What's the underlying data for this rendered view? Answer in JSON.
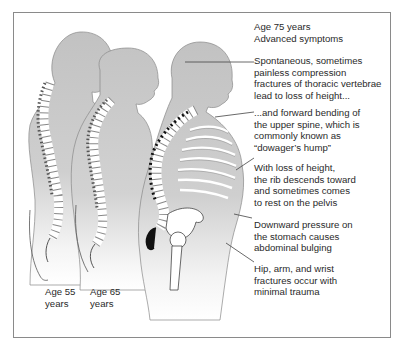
{
  "figure": {
    "ages": [
      {
        "label": "Age 55\nyears"
      },
      {
        "label": "Age 65\nyears"
      }
    ],
    "header": {
      "age": "Age 75 years",
      "subtitle": "Advanced symptoms"
    },
    "annotations": [
      {
        "text": "Spontaneous, sometimes\npainless compression\nfractures of thoracic vertebrae\nlead to loss of height..."
      },
      {
        "text": "...and forward bending of\nthe upper spine, which is\ncommonly known as\n“dowager’s hump”"
      },
      {
        "text": "With loss of height,\nthe rib descends toward\nand sometimes comes\nto rest on the pelvis"
      },
      {
        "text": "Downward pressure on\nthe stomach causes\nabdominal bulging"
      },
      {
        "text": "Hip, arm, and wrist\nfractures occur with\nminimal trauma"
      }
    ],
    "colors": {
      "silhouette": "#c4c4c4",
      "outline": "#555555",
      "bone": "#ffffff",
      "frame": "#8a8a8a",
      "text": "#2a2a2a"
    }
  }
}
